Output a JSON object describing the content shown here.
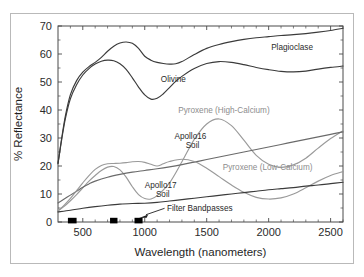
{
  "chart_data": {
    "type": "line",
    "title": "",
    "xlabel": "Wavelength  (nanometers)",
    "ylabel": "% Reflectance",
    "xlim": [
      300,
      2600
    ],
    "ylim": [
      0,
      70
    ],
    "xticks": [
      500,
      1000,
      1500,
      2000,
      2500
    ],
    "yticks": [
      0,
      10,
      20,
      30,
      40,
      50,
      60,
      70
    ],
    "grid": false,
    "legend_position": "inline-annotations",
    "series": [
      {
        "name": "Plagioclase",
        "color": "#3b3b3b",
        "label_x": 2050,
        "label_y": 62,
        "x": [
          300,
          330,
          360,
          400,
          450,
          500,
          550,
          600,
          650,
          700,
          750,
          800,
          850,
          900,
          950,
          1000,
          1050,
          1100,
          1150,
          1200,
          1250,
          1300,
          1400,
          1500,
          1600,
          1700,
          1800,
          1900,
          2000,
          2100,
          2200,
          2300,
          2400,
          2500,
          2600
        ],
        "y": [
          21.0,
          30.0,
          38.0,
          45.5,
          50.5,
          53.5,
          55.5,
          57.0,
          58.8,
          61.0,
          62.8,
          63.9,
          64.3,
          63.8,
          62.0,
          59.2,
          57.8,
          57.0,
          56.6,
          56.4,
          56.5,
          57.3,
          59.8,
          62.0,
          63.4,
          64.4,
          65.2,
          65.8,
          66.2,
          66.6,
          66.9,
          67.3,
          67.8,
          68.4,
          69.2
        ]
      },
      {
        "name": "Olivine",
        "color": "#3b3b3b",
        "label_x": 1150,
        "label_y": 51,
        "x": [
          300,
          330,
          360,
          400,
          450,
          500,
          550,
          600,
          650,
          700,
          750,
          800,
          850,
          900,
          950,
          1000,
          1050,
          1100,
          1150,
          1200,
          1250,
          1300,
          1400,
          1500,
          1600,
          1700,
          1800,
          1900,
          2000,
          2100,
          2200,
          2300,
          2400,
          2500,
          2600
        ],
        "y": [
          20.8,
          29.5,
          37.0,
          44.0,
          49.0,
          52.5,
          54.8,
          56.4,
          57.4,
          57.8,
          57.6,
          56.5,
          54.5,
          51.5,
          48.2,
          45.4,
          43.9,
          44.2,
          45.8,
          48.0,
          50.2,
          52.0,
          54.8,
          56.6,
          57.3,
          57.0,
          56.2,
          55.2,
          54.4,
          53.8,
          53.6,
          53.9,
          54.6,
          55.2,
          55.7
        ]
      },
      {
        "name": "Pyroxene  (High-Calcium)",
        "color": "#9a9a9a",
        "label_x": 1330,
        "label_y": 39,
        "x": [
          300,
          350,
          400,
          450,
          500,
          550,
          600,
          650,
          700,
          750,
          800,
          850,
          900,
          950,
          1000,
          1050,
          1100,
          1200,
          1300,
          1400,
          1500,
          1600,
          1700,
          1800,
          1900,
          2000,
          2100,
          2200,
          2300,
          2400,
          2500,
          2600
        ],
        "y": [
          4.0,
          5.6,
          7.6,
          9.8,
          12.2,
          14.6,
          16.6,
          18.4,
          19.6,
          19.8,
          18.6,
          16.0,
          12.6,
          9.8,
          8.4,
          8.2,
          9.4,
          14.0,
          21.5,
          29.5,
          35.0,
          36.8,
          34.4,
          29.2,
          23.8,
          20.6,
          19.5,
          20.4,
          22.8,
          26.4,
          29.8,
          32.6
        ]
      },
      {
        "name": "Apollo16 Soil",
        "color": "#6a6a6a",
        "label_x": 1260,
        "label_y": 30,
        "x": [
          300,
          350,
          400,
          450,
          500,
          550,
          600,
          700,
          800,
          900,
          1000,
          1100,
          1200,
          1300,
          1400,
          1500,
          1600,
          1700,
          1800,
          1900,
          2000,
          2100,
          2200,
          2300,
          2400,
          2500,
          2600
        ],
        "y": [
          6.8,
          8.2,
          9.6,
          11.0,
          12.4,
          13.6,
          14.6,
          16.0,
          17.0,
          17.8,
          18.4,
          19.0,
          19.7,
          20.5,
          21.4,
          22.3,
          23.2,
          24.1,
          25.0,
          25.9,
          26.8,
          27.7,
          28.6,
          29.5,
          30.4,
          31.3,
          32.2
        ]
      },
      {
        "name": "Pyroxene  (Low-Calcium)",
        "color": "#9a9a9a",
        "label_x": 1700,
        "label_y": 18.5,
        "x": [
          300,
          350,
          400,
          450,
          500,
          550,
          600,
          650,
          700,
          750,
          800,
          850,
          900,
          950,
          1000,
          1050,
          1100,
          1150,
          1200,
          1300,
          1400,
          1500,
          1600,
          1700,
          1800,
          1900,
          2000,
          2100,
          2200,
          2300,
          2400,
          2500,
          2600
        ],
        "y": [
          4.0,
          6.0,
          8.4,
          11.2,
          14.0,
          16.6,
          18.8,
          20.2,
          20.8,
          20.9,
          21.0,
          21.2,
          21.5,
          21.6,
          21.3,
          20.6,
          20.0,
          20.8,
          21.6,
          22.4,
          21.6,
          19.2,
          16.2,
          13.2,
          10.6,
          8.8,
          8.2,
          8.6,
          10.0,
          12.2,
          14.6,
          16.6,
          18.0
        ]
      },
      {
        "name": "Apollo17 Soil",
        "color": "#3b3b3b",
        "label_x": 1040,
        "label_y": 12,
        "x": [
          300,
          400,
          500,
          600,
          700,
          800,
          900,
          1000,
          1100,
          1200,
          1300,
          1400,
          1500,
          1600,
          1700,
          1800,
          1900,
          2000,
          2100,
          2200,
          2300,
          2400,
          2500,
          2600
        ],
        "y": [
          3.6,
          4.2,
          4.9,
          5.5,
          6.0,
          6.4,
          6.6,
          6.7,
          7.0,
          7.5,
          8.0,
          8.5,
          9.0,
          9.5,
          10.0,
          10.5,
          11.0,
          11.5,
          11.9,
          12.3,
          12.8,
          13.2,
          13.7,
          14.2
        ]
      }
    ],
    "bandpasses": {
      "label": "Filter  Bandpasses",
      "label_x": 1290,
      "label_y": 4.4,
      "bars": [
        {
          "center": 415,
          "width": 70
        },
        {
          "center": 750,
          "width": 60
        },
        {
          "center": 950,
          "width": 65
        }
      ]
    }
  },
  "labels": {
    "y_axis_title": "% Reflectance",
    "x_axis_title": "Wavelength  (nanometers)",
    "yticks": [
      "0",
      "10",
      "20",
      "30",
      "40",
      "50",
      "60",
      "70"
    ],
    "xticks": [
      "500",
      "1000",
      "1500",
      "2000",
      "2500"
    ],
    "series_names": {
      "plagioclase": "Plagioclase",
      "olivine": "Olivine",
      "pyroxene_high": "Pyroxene  (High-Calcium)",
      "apollo16_line1": "Apollo16",
      "apollo16_line2": "Soil",
      "pyroxene_low": "Pyroxene  (Low-Calcium)",
      "apollo17_line1": "Apollo17",
      "apollo17_line2": "Soil",
      "filter_bandpasses": "Filter  Bandpasses"
    }
  },
  "colors": {
    "dark": "#3b3b3b",
    "mid": "#6a6a6a",
    "light": "#9a9a9a",
    "frame": "#b9b9b9",
    "bandpass": "#000000"
  }
}
